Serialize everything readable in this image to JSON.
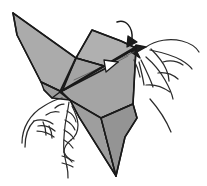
{
  "figure": {
    "kind": "origami-folding-diagram",
    "background_color": "#ffffff",
    "title": "",
    "caption": "",
    "step_number": ""
  },
  "palette": {
    "paper_fill_light": "#b2b2b2",
    "paper_fill_mid": "#a6a6a6",
    "paper_fill_dark": "#9a9a9a",
    "paper_fill_darkest": "#8f8f8f",
    "outline": "#1a1a1a",
    "hidden_crease": "#5a5a5a",
    "hand_stroke": "#2b2b2b",
    "arrow_fill_hollow": "#ffffff",
    "background": "#ffffff"
  },
  "paper": {
    "facets": [
      {
        "name": "left-wing-upper",
        "fill": "#ababab",
        "points": "13,13 76,58 62,92 41,82 17,35"
      },
      {
        "name": "left-wing-lower-flap",
        "fill": "#9d9d9d",
        "points": "41,82 62,92 70,100 52,98 44,90"
      },
      {
        "name": "center-panel-top",
        "fill": "#b0b0b0",
        "points": "76,58 92,30 121,41 136,48 104,66"
      },
      {
        "name": "center-panel-main",
        "fill": "#a4a4a4",
        "points": "76,58 104,66 136,48 133,104 101,118 70,100 62,92"
      },
      {
        "name": "lower-tail-triangle",
        "fill": "#9e9e9e",
        "points": "70,100 101,118 116,176 79,117"
      },
      {
        "name": "right-lower-flap",
        "fill": "#949494",
        "points": "101,118 133,104 137,118 125,137 116,176"
      },
      {
        "name": "right-spike",
        "fill": "#1f1f1f",
        "points": "136,45 146,47 137,52 140,58 131,52"
      }
    ],
    "fold_lines": [
      {
        "name": "left-wing-leading-edge",
        "d": "M13,13 L76,58",
        "width": 1.6
      },
      {
        "name": "left-wing-trailing-edge",
        "d": "M13,13 L17,35 L41,82 L62,92",
        "width": 1.6
      },
      {
        "name": "wing-to-center-ridge",
        "d": "M76,58 L92,30 L121,41 L136,48",
        "width": 1.6
      },
      {
        "name": "center-spine-fold",
        "d": "M76,58 L104,66 L136,48",
        "width": 1.6
      },
      {
        "name": "main-diagonal-fold",
        "d": "M60,92 L136,47",
        "width": 2.2
      },
      {
        "name": "secondary-diagonal-fold",
        "d": "M60,92 L133,50",
        "width": 1.2
      },
      {
        "name": "hinge-to-apex",
        "d": "M60,92 L76,58",
        "width": 2.0
      },
      {
        "name": "hinge-to-lower-point",
        "d": "M60,92 L70,100 L101,118",
        "width": 1.8
      },
      {
        "name": "hinge-small-tab",
        "d": "M60,92 L52,98 L44,90",
        "width": 1.4
      },
      {
        "name": "center-right-edge",
        "d": "M136,48 L133,104 L137,118 L125,137 L116,176",
        "width": 1.6
      },
      {
        "name": "tail-left-edge",
        "d": "M70,100 L79,117 L116,176",
        "width": 1.6
      },
      {
        "name": "tail-cross-fold",
        "d": "M101,118 L133,104",
        "width": 1.5
      },
      {
        "name": "tail-notch-fold",
        "d": "M101,118 L116,176",
        "width": 1.4
      }
    ],
    "hidden_creases": [
      {
        "name": "hidden-crease-upper",
        "d": "M74,80 L134,52",
        "width": 0.8
      },
      {
        "name": "hidden-crease-lower",
        "d": "M64,90 L128,56",
        "width": 0.8
      }
    ]
  },
  "arrows": [
    {
      "name": "fold-direction-arrow-top",
      "description": "curved arrow descending from above onto the right corner",
      "path": "M117,22 C126,19 133,27 132,39",
      "head": "128,36 137,42 127,47",
      "head_style": "solid"
    },
    {
      "name": "pull-direction-arrow-center",
      "description": "hollow arrowhead pointing right along the main fold",
      "path": "M64,90 L118,62",
      "head": "104,60 118,62 106,72",
      "head_style": "hollow"
    }
  ],
  "hands": {
    "right_hand": {
      "name": "right-hand",
      "description": "fingers pinching the right corner of the paper",
      "strokes": [
        "M146,47 C156,40 170,38 182,41 C190,43 196,47 199,52",
        "M150,50 C160,52 172,55 181,60 C186,63 190,66 192,69",
        "M151,49 C157,55 163,62 166,69 C168,73 169,77 169,81",
        "M163,62 C170,60 177,61 183,65",
        "M146,57 C153,63 160,71 165,80 C169,87 172,94 173,99",
        "M158,73 C165,72 172,74 178,79",
        "M141,60 C145,68 150,78 153,87",
        "M139,62 C141,70 143,78 144,85",
        "M146,85 C154,84 163,87 170,92",
        "M150,99 C158,108 166,120 171,132",
        "M134,60 C137,66 139,72 140,77"
      ]
    },
    "left_hand": {
      "name": "left-hand",
      "description": "fingers supporting the left underside of the paper",
      "strokes": [
        "M22,143 C22,128 30,114 44,106 C52,101 58,99 62,98",
        "M25,147 C25,136 28,127 34,121",
        "M34,121 C40,119 47,120 53,124",
        "M38,126 C44,125 50,127 55,131",
        "M37,131 C43,131 49,133 54,137",
        "M46,115 C50,112 55,111 59,112",
        "M55,108 C58,105 61,104 64,104",
        "M43,122 C45,126 46,131 46,135",
        "M49,126 C51,130 52,134 52,138"
      ]
    }
  },
  "cord": {
    "name": "twisted-cord",
    "description": "braided cord hanging from the underside of the model",
    "strokes": [
      "M69,102 C68,110 66,118 65,126 C64,135 63,144 64,152 C65,158 66,163 67,167",
      "M72,106 C75,112 78,118 78,125 C78,132 75,137 71,140",
      "M71,140 C67,143 64,147 64,152",
      "M64,152 C66,157 70,160 74,161",
      "M67,111 C71,113 75,117 76,122",
      "M65,120 C69,122 73,125 75,130",
      "M64,130 C68,132 72,135 74,139",
      "M64,140 C68,142 71,145 73,148",
      "M62,156 C66,157 70,159 72,162",
      "M62,163 C66,164 70,165 73,167",
      "M67,167 C68,171 68,175 68,178"
    ]
  }
}
